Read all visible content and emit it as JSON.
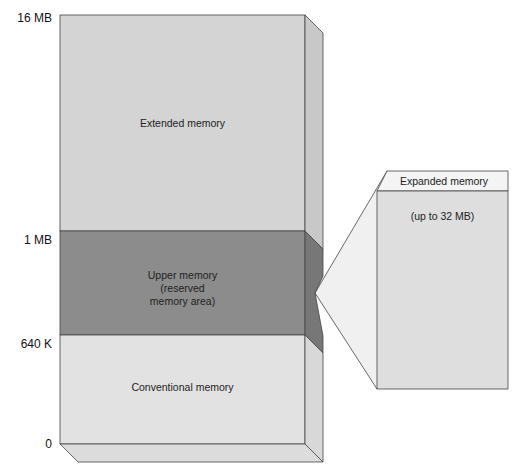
{
  "diagram": {
    "axis_labels": [
      {
        "text": "16 MB",
        "y": 18
      },
      {
        "text": "1 MB",
        "y": 233
      },
      {
        "text": "640 K",
        "y": 337
      },
      {
        "text": "0",
        "y": 446
      }
    ],
    "regions": {
      "extended": {
        "label": "Extended memory"
      },
      "upper": {
        "line1": "Upper memory",
        "line2": "(reserved",
        "line3": "memory area)"
      },
      "conventional": {
        "label": "Conventional memory"
      }
    },
    "expanded": {
      "header": "Expanded memory",
      "note": "(up to 32 MB)"
    },
    "colors": {
      "light_gray": "#d6d6d6",
      "lighter_gray": "#e3e3e3",
      "dark_gray": "#8a8a8a",
      "side_dark": "#777777",
      "outline": "#444444",
      "wedge": "#f2f2f2"
    }
  }
}
